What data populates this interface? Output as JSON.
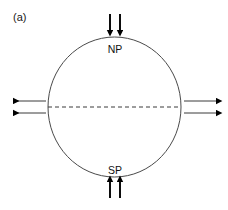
{
  "figure": {
    "panel_label": "(a)",
    "width": 228,
    "height": 210,
    "background_color": "#ffffff",
    "stroke_color": "#000000",
    "line_color": "#333333"
  },
  "body_outline": {
    "shape": "circle",
    "center_x": 114.5,
    "center_y": 107,
    "radius_x": 66.5,
    "radius_y": 70,
    "stroke_color": "#4a4a4a",
    "stroke_width": 1
  },
  "equator": {
    "label": "",
    "y": 107,
    "x_start": 48,
    "x_end": 181,
    "style": "dashed",
    "dash_pattern": "4 3",
    "stroke_color": "#3a3a3a"
  },
  "labels": {
    "north_pole": "NP",
    "south_pole": "SP"
  },
  "arrows": {
    "top": {
      "name": "top-arrows",
      "direction": "down",
      "count": 2,
      "description": "two downward arrows above the north pole",
      "x_positions": [
        110,
        120
      ],
      "y_start": 14,
      "y_end": 31,
      "color": "#000000"
    },
    "bottom": {
      "name": "bottom-arrows",
      "direction": "up",
      "count": 2,
      "description": "two upward arrows below the south pole",
      "x_positions": [
        110,
        120
      ],
      "y_start": 198,
      "y_end": 181,
      "color": "#000000"
    },
    "left": {
      "name": "left-arrows",
      "direction": "left",
      "count": 2,
      "description": "two leftward arrows at the equator, outside the left limb",
      "y_positions": [
        101,
        113
      ],
      "x_start": 46,
      "x_end": 11,
      "color": "#000000"
    },
    "right": {
      "name": "right-arrows",
      "direction": "right",
      "count": 2,
      "description": "two rightward arrows at the equator, outside the right limb",
      "y_positions": [
        101,
        113
      ],
      "x_start": 183,
      "x_end": 218,
      "color": "#000000"
    }
  }
}
